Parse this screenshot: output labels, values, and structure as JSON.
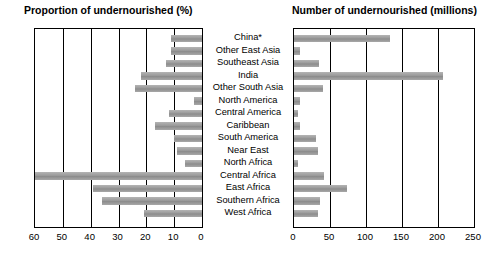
{
  "chart_data": {
    "type": "bar",
    "panels": [
      {
        "id": "left",
        "title": "Proportion of undernourished (%)",
        "xlabel": "",
        "ylabel": "",
        "orientation": "horizontal-reversed",
        "xlim": [
          60,
          0
        ],
        "ticks": [
          "60",
          "50",
          "40",
          "30",
          "20",
          "10",
          "0"
        ],
        "tick_values": [
          60,
          50,
          40,
          30,
          20,
          10,
          0
        ],
        "grid": true,
        "values": [
          11,
          11,
          13,
          22,
          24,
          3,
          12,
          17,
          10,
          9,
          6,
          60,
          39,
          36,
          21,
          17
        ]
      },
      {
        "id": "right",
        "title": "Number of undernourished (millions)",
        "xlabel": "",
        "ylabel": "",
        "orientation": "horizontal",
        "xlim": [
          0,
          250
        ],
        "ticks": [
          "0",
          "50",
          "100",
          "150",
          "200",
          "250"
        ],
        "tick_values": [
          0,
          50,
          100,
          150,
          200,
          250
        ],
        "grid": true,
        "values": [
          133,
          8,
          35,
          207,
          40,
          9,
          6,
          9,
          30,
          33,
          5,
          42,
          73,
          36,
          33,
          0
        ]
      }
    ],
    "categories": [
      "China*",
      "Other East Asia",
      "Southeast Asia",
      "India",
      "Other South Asia",
      "North America",
      "Central America",
      "Caribbean",
      "South America",
      "Near East",
      "North Africa",
      "Central Africa",
      "East Africa",
      "Southern Africa",
      "West Africa"
    ],
    "legend": [],
    "annotations": [
      {
        "text": "*Includes Taiwan Province of China"
      }
    ]
  }
}
